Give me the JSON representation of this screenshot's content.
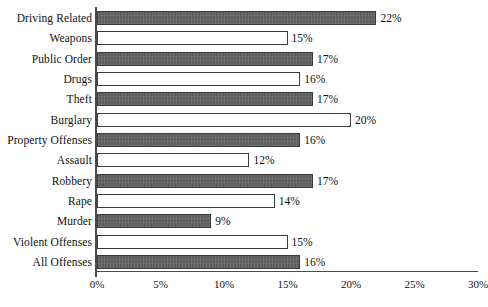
{
  "chart_data": {
    "type": "bar",
    "orientation": "horizontal",
    "title": "",
    "xlabel": "",
    "ylabel": "",
    "xlim": [
      0,
      30
    ],
    "xticks": [
      "0%",
      "5%",
      "10%",
      "15%",
      "20%",
      "25%",
      "30%"
    ],
    "xtick_values": [
      0,
      5,
      10,
      15,
      20,
      25,
      30
    ],
    "grid": false,
    "legend": "none",
    "value_suffix": "%",
    "categories": [
      "Driving Related",
      "Weapons",
      "Public Order",
      "Drugs",
      "Theft",
      "Burglary",
      "Property Offenses",
      "Assault",
      "Robbery",
      "Rape",
      "Murder",
      "Violent Offenses",
      "All Offenses"
    ],
    "values": [
      22,
      15,
      17,
      16,
      17,
      20,
      16,
      12,
      17,
      14,
      9,
      15,
      16
    ],
    "data_labels": [
      "22%",
      "15%",
      "17%",
      "16%",
      "17%",
      "20%",
      "16%",
      "12%",
      "17%",
      "14%",
      "9%",
      "15%",
      "16%"
    ],
    "bar_styles": [
      "dark",
      "light",
      "dark",
      "light",
      "dark",
      "light",
      "dark",
      "light",
      "dark",
      "light",
      "dark",
      "light",
      "dark"
    ],
    "colors": {
      "bar_dark_fill": "#5d5d5d",
      "bar_light_fill": "#ffffff",
      "bar_outline": "#3a3a3a",
      "axis": "#4a4a4a",
      "text": "#111111",
      "background": "#ffffff"
    }
  }
}
